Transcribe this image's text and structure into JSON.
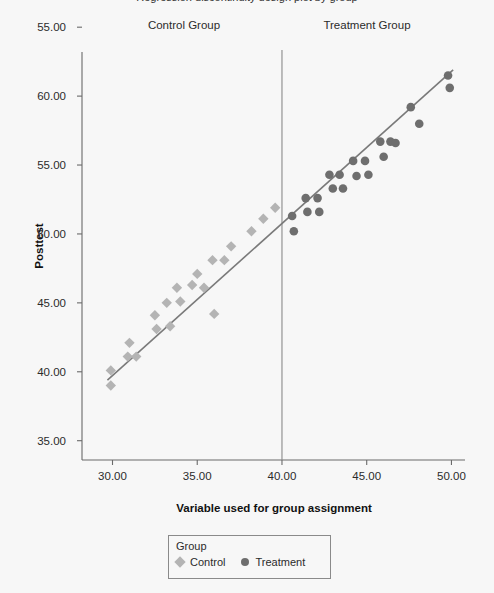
{
  "figure": {
    "clipped_title": "Regression discontinuity design plot by group",
    "background_color": "#f7f7f7"
  },
  "band_labels": {
    "control": "Control Group",
    "treatment": "Treatment Group"
  },
  "legend": {
    "title": "Group",
    "entries": [
      {
        "label": "Control",
        "marker": "diamond",
        "color": "#b4b4b4"
      },
      {
        "label": "Treatment",
        "marker": "circle",
        "color": "#6e6e6e"
      }
    ]
  },
  "colors": {
    "control": "#b4b4b4",
    "treatment": "#6e6e6e",
    "regression_line": "#7a7a7a",
    "cutoff_line": "#8a8a8a",
    "axis": "#6a6a6a",
    "text": "#2b2b2b"
  },
  "chart_data": {
    "type": "scatter",
    "title": "",
    "xlabel": "Variable used for group assignment",
    "ylabel": "Posttest",
    "xlim": [
      28.2,
      50.8
    ],
    "ylim": [
      33.6,
      63.2
    ],
    "xticks": [
      30.0,
      35.0,
      40.0,
      45.0,
      50.0
    ],
    "xtick_labels": [
      "30.00",
      "35.00",
      "40.00",
      "45.00",
      "50.00"
    ],
    "yticks": [
      65.0,
      60.0,
      55.0,
      50.0,
      45.0,
      40.0,
      35.0
    ],
    "ytick_labels": [
      "55.00",
      "60.00",
      "55.00",
      "50.00",
      "45.00",
      "40.00",
      "35.00"
    ],
    "grid": false,
    "legend_position": "bottom-center",
    "cutoff": {
      "x": 40.0,
      "label": "assignment cutoff",
      "line_style": "solid"
    },
    "series": [
      {
        "name": "Control",
        "marker": "diamond",
        "color": "#b4b4b4",
        "points": [
          [
            29.9,
            40.1
          ],
          [
            29.9,
            39.0
          ],
          [
            30.9,
            41.1
          ],
          [
            31.0,
            42.1
          ],
          [
            31.4,
            41.1
          ],
          [
            32.5,
            44.1
          ],
          [
            32.6,
            43.1
          ],
          [
            33.2,
            45.0
          ],
          [
            33.4,
            43.3
          ],
          [
            33.8,
            46.1
          ],
          [
            34.0,
            45.1
          ],
          [
            34.7,
            46.3
          ],
          [
            35.0,
            47.1
          ],
          [
            35.4,
            46.1
          ],
          [
            35.9,
            48.1
          ],
          [
            36.0,
            44.2
          ],
          [
            36.6,
            48.1
          ],
          [
            37.0,
            49.1
          ],
          [
            38.2,
            50.2
          ],
          [
            38.9,
            51.1
          ],
          [
            39.6,
            51.9
          ]
        ]
      },
      {
        "name": "Treatment",
        "marker": "circle",
        "color": "#6e6e6e",
        "points": [
          [
            40.6,
            51.3
          ],
          [
            40.7,
            50.2
          ],
          [
            41.4,
            52.6
          ],
          [
            41.5,
            51.6
          ],
          [
            42.1,
            52.6
          ],
          [
            42.2,
            51.6
          ],
          [
            42.8,
            54.3
          ],
          [
            43.0,
            53.3
          ],
          [
            43.4,
            54.3
          ],
          [
            43.6,
            53.3
          ],
          [
            44.2,
            55.3
          ],
          [
            44.4,
            54.2
          ],
          [
            44.9,
            55.3
          ],
          [
            45.1,
            54.3
          ],
          [
            45.8,
            56.7
          ],
          [
            46.0,
            55.6
          ],
          [
            46.4,
            56.7
          ],
          [
            46.7,
            56.6
          ],
          [
            47.6,
            59.2
          ],
          [
            48.1,
            58.0
          ],
          [
            49.8,
            61.5
          ],
          [
            49.9,
            60.6
          ]
        ]
      }
    ],
    "regression_line": {
      "name": "fitted line",
      "color": "#7a7a7a",
      "x_start": 29.7,
      "y_start": 39.4,
      "x_end": 50.1,
      "y_end": 61.9,
      "continuous_at_cutoff": true
    }
  }
}
